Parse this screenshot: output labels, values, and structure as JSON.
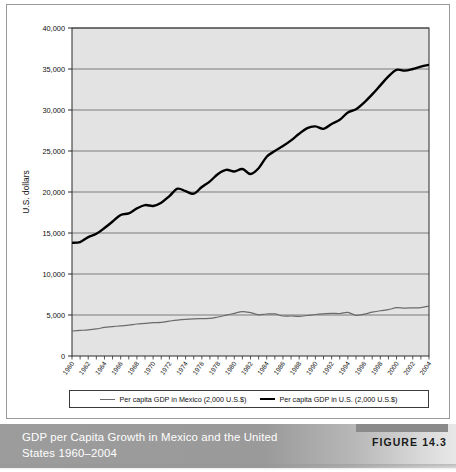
{
  "figure": {
    "caption": "GDP per Capita Growth in Mexico and the United States 1960–2004",
    "tag": "FIGURE 14.3"
  },
  "legend": {
    "items": [
      {
        "label": "Per capita GDP in Mexico (2,000 U.S.$)",
        "color": "#6b6b6b",
        "swatch": "mexico"
      },
      {
        "label": "Per capita GDP in U.S. (2,000 U.S.$)",
        "color": "#000000",
        "swatch": "us"
      }
    ]
  },
  "chart_data": {
    "type": "line",
    "title": "GDP per Capita Growth in Mexico and the United States 1960–2004",
    "xlabel": "",
    "ylabel": "U.S. dollars",
    "xlim": [
      1960,
      2004
    ],
    "ylim": [
      0,
      40000
    ],
    "grid": true,
    "legend_position": "bottom",
    "plot_background": "#e3e3e3",
    "ytick_labels": [
      "0",
      "5,000",
      "10,000",
      "15,000",
      "20,000",
      "25,000",
      "30,000",
      "35,000",
      "40,000"
    ],
    "ytick_values": [
      0,
      5000,
      10000,
      15000,
      20000,
      25000,
      30000,
      35000,
      40000
    ],
    "xtick_labels": [
      "1960",
      "1962",
      "1964",
      "1966",
      "1968",
      "1970",
      "1972",
      "1974",
      "1976",
      "1978",
      "1980",
      "1982",
      "1984",
      "1986",
      "1988",
      "1990",
      "1992",
      "1994",
      "1996",
      "1998",
      "2000",
      "2002",
      "2004"
    ],
    "x": [
      1960,
      1961,
      1962,
      1963,
      1964,
      1965,
      1966,
      1967,
      1968,
      1969,
      1970,
      1971,
      1972,
      1973,
      1974,
      1975,
      1976,
      1977,
      1978,
      1979,
      1980,
      1981,
      1982,
      1983,
      1984,
      1985,
      1986,
      1987,
      1988,
      1989,
      1990,
      1991,
      1992,
      1993,
      1994,
      1995,
      1996,
      1997,
      1998,
      1999,
      2000,
      2001,
      2002,
      2003,
      2004
    ],
    "series": [
      {
        "name": "Per capita GDP in U.S. (2,000 U.S.$)",
        "color": "#000000",
        "values": [
          13800,
          13900,
          14500,
          14900,
          15600,
          16400,
          17200,
          17400,
          18000,
          18400,
          18300,
          18700,
          19500,
          20400,
          20100,
          19800,
          20600,
          21300,
          22200,
          22700,
          22500,
          22800,
          22200,
          22900,
          24300,
          25000,
          25600,
          26300,
          27100,
          27800,
          28000,
          27700,
          28300,
          28800,
          29700,
          30100,
          30900,
          31900,
          33000,
          34100,
          34900,
          34800,
          35000,
          35300,
          35500
        ]
      },
      {
        "name": "Per capita GDP in Mexico (2,000 U.S.$)",
        "color": "#6b6b6b",
        "values": [
          3050,
          3120,
          3180,
          3300,
          3480,
          3580,
          3680,
          3760,
          3900,
          3980,
          4060,
          4100,
          4250,
          4380,
          4470,
          4530,
          4560,
          4580,
          4760,
          4980,
          5200,
          5420,
          5280,
          5020,
          5120,
          5130,
          4880,
          4880,
          4840,
          4940,
          5060,
          5140,
          5200,
          5180,
          5320,
          4960,
          5100,
          5340,
          5520,
          5650,
          5900,
          5850,
          5870,
          5900,
          6100
        ]
      }
    ]
  }
}
